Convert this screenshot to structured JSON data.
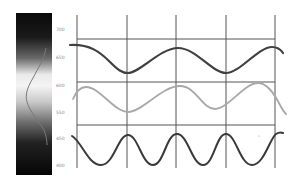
{
  "figure": {
    "spectrum_bar": {
      "tick_labels": [
        "700",
        "650",
        "600",
        "550",
        "450",
        "400"
      ],
      "gradient": "black at both ends, white near center"
    },
    "waves": [
      {
        "name": "long-wavelength-wave",
        "color": "#404040",
        "period_px": 97
      },
      {
        "name": "medium-wavelength-wave",
        "color": "#a8a8a8",
        "period_px": 93
      },
      {
        "name": "short-wavelength-wave",
        "color": "#3a3a3a",
        "period_px": 49
      }
    ],
    "grid": {
      "color": "#555555",
      "vertical_lines": 5,
      "horizontal_lines": 3
    }
  }
}
